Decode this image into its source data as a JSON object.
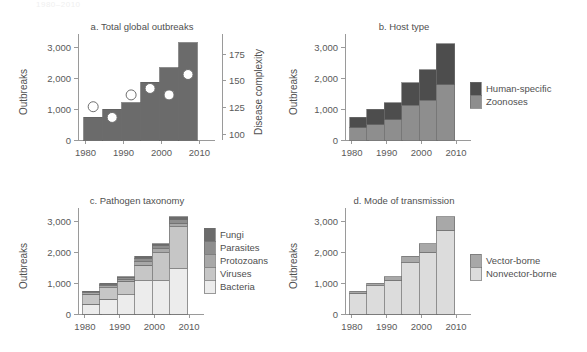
{
  "figure": {
    "cut_off_header": "1980–2010",
    "width": 587,
    "height": 352
  },
  "colors": {
    "dark": "#4d4d4d",
    "mid_dark": "#6b6b6b",
    "mid": "#8e8e8e",
    "mid_light": "#a8a8a8",
    "light": "#c6c6c6",
    "lighter": "#d8d8d8",
    "lightest": "#ececec",
    "axis": "#9a9a9a",
    "text": "#4f4f4f",
    "marker_fill": "#ffffff",
    "marker_stroke": "#6e6e6e"
  },
  "axis": {
    "x_ticks": [
      "1980",
      "1990",
      "2000",
      "2010"
    ],
    "y_ticks": [
      "0",
      "1,000",
      "2,000",
      "3,000"
    ],
    "y_label": "Outbreaks",
    "y2_ticks": [
      "100",
      "125",
      "150",
      "175"
    ],
    "y2_label": "Disease complexity",
    "ylim": [
      0,
      3300
    ],
    "y2lim": [
      95,
      190
    ],
    "xlim": [
      1978,
      2012
    ]
  },
  "chart_data": [
    {
      "id": "panel-a",
      "type": "bar",
      "title": "a. Total global outbreaks",
      "xlabel": "",
      "ylabel": "Outbreaks",
      "y2label": "Disease complexity",
      "ylim": [
        0,
        3300
      ],
      "y2lim": [
        95,
        190
      ],
      "grid": false,
      "legend": "none",
      "categories": [
        "1980-1984",
        "1985-1989",
        "1990-1994",
        "1995-1999",
        "2000-2004",
        "2005-2010"
      ],
      "x": [
        1982,
        1987,
        1992,
        1997,
        2002,
        2007
      ],
      "values": [
        740,
        1000,
        1200,
        1870,
        2330,
        3150
      ],
      "series": [
        {
          "name": "Outbreaks",
          "axis": "left",
          "render": "bar",
          "values": [
            740,
            1000,
            1200,
            1870,
            2330,
            3150
          ]
        },
        {
          "name": "Disease complexity",
          "axis": "right",
          "render": "point",
          "values": [
            126,
            116,
            137,
            143,
            137,
            156
          ]
        }
      ]
    },
    {
      "id": "panel-b",
      "type": "bar",
      "title": "b. Host type",
      "xlabel": "",
      "ylabel": "Outbreaks",
      "ylim": [
        0,
        3300
      ],
      "grid": false,
      "stacked": true,
      "legend": "right",
      "categories": [
        "1980-1984",
        "1985-1989",
        "1990-1994",
        "1995-1999",
        "2000-2004",
        "2005-2010"
      ],
      "x": [
        1982,
        1987,
        1992,
        1997,
        2002,
        2007
      ],
      "series": [
        {
          "name": "Zoonoses",
          "color": "#8e8e8e",
          "values": [
            400,
            500,
            660,
            1120,
            1280,
            1780
          ]
        },
        {
          "name": "Human-specific",
          "color": "#4d4d4d",
          "values": [
            330,
            500,
            550,
            740,
            1000,
            1340
          ]
        }
      ],
      "legend_order": [
        "Human-specific",
        "Zoonoses"
      ]
    },
    {
      "id": "panel-c",
      "type": "bar",
      "title": "c. Pathogen taxonomy",
      "xlabel": "",
      "ylabel": "Outbreaks",
      "ylim": [
        0,
        3300
      ],
      "grid": false,
      "stacked": true,
      "legend": "right",
      "categories": [
        "1980-1984",
        "1985-1989",
        "1990-1994",
        "1995-1999",
        "2000-2004",
        "2005-2010"
      ],
      "x": [
        1982,
        1987,
        1992,
        1997,
        2002,
        2007
      ],
      "series": [
        {
          "name": "Bacteria",
          "color": "#ececec",
          "values": [
            320,
            470,
            620,
            1080,
            1080,
            1460
          ]
        },
        {
          "name": "Viruses",
          "color": "#c6c6c6",
          "values": [
            320,
            380,
            440,
            500,
            900,
            1360
          ]
        },
        {
          "name": "Protozoans",
          "color": "#a8a8a8",
          "values": [
            50,
            70,
            70,
            110,
            130,
            120
          ]
        },
        {
          "name": "Parasites",
          "color": "#8e8e8e",
          "values": [
            30,
            50,
            40,
            110,
            110,
            110
          ]
        },
        {
          "name": "Fungi",
          "color": "#6b6b6b",
          "values": [
            20,
            30,
            30,
            70,
            60,
            90
          ]
        }
      ],
      "legend_order": [
        "Fungi",
        "Parasites",
        "Protozoans",
        "Viruses",
        "Bacteria"
      ]
    },
    {
      "id": "panel-d",
      "type": "bar",
      "title": "d. Mode of transmission",
      "xlabel": "",
      "ylabel": "Outbreaks",
      "ylim": [
        0,
        3300
      ],
      "grid": false,
      "stacked": true,
      "legend": "right",
      "categories": [
        "1980-1984",
        "1985-1989",
        "1990-1994",
        "1995-1999",
        "2000-2004",
        "2005-2010"
      ],
      "x": [
        1982,
        1987,
        1992,
        1997,
        2002,
        2007
      ],
      "series": [
        {
          "name": "Nonvector-borne",
          "color": "#dcdcdc",
          "values": [
            670,
            920,
            1100,
            1660,
            1990,
            2710
          ]
        },
        {
          "name": "Vector-borne",
          "color": "#a8a8a8",
          "values": [
            70,
            80,
            100,
            210,
            290,
            440
          ]
        }
      ],
      "legend_order": [
        "Vector-borne",
        "Nonvector-borne"
      ]
    }
  ]
}
